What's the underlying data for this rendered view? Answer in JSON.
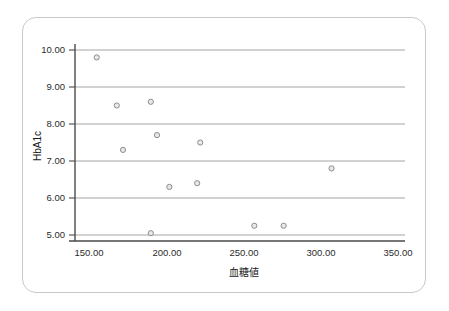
{
  "chart_data": {
    "type": "scatter",
    "title": "",
    "xlabel": "血糖値",
    "ylabel": "HbA1c",
    "xlim": [
      130,
      365
    ],
    "ylim": [
      4.6,
      10.3
    ],
    "grid": true,
    "grid_axis": "y",
    "legend": "none",
    "xticks": [
      150,
      200,
      250,
      300,
      350
    ],
    "xtick_labels": [
      "150.00",
      "200.00",
      "250.00",
      "300.00",
      "350.00"
    ],
    "yticks": [
      5,
      6,
      7,
      8,
      9,
      10
    ],
    "ytick_labels": [
      "5.00",
      "6.00",
      "7.00",
      "8.00",
      "9.00",
      "10.00"
    ],
    "series": [
      {
        "name": "patients",
        "marker": "open-circle",
        "marker_fill": "#e8e8e8",
        "marker_stroke": "#8d8d8d",
        "points": [
          {
            "x": 155,
            "y": 9.8
          },
          {
            "x": 168,
            "y": 8.5
          },
          {
            "x": 190,
            "y": 8.6
          },
          {
            "x": 194,
            "y": 7.7
          },
          {
            "x": 222,
            "y": 7.5
          },
          {
            "x": 172,
            "y": 7.3
          },
          {
            "x": 307,
            "y": 6.8
          },
          {
            "x": 220,
            "y": 6.4
          },
          {
            "x": 202,
            "y": 6.3
          },
          {
            "x": 257,
            "y": 5.25
          },
          {
            "x": 276,
            "y": 5.25
          },
          {
            "x": 190,
            "y": 5.05
          }
        ]
      }
    ]
  },
  "figure": {
    "card_border_color": "#c9c9c9",
    "background_color": "#ffffff",
    "axis_color": "#4a4a4a",
    "grid_color": "#9a9a9a"
  }
}
